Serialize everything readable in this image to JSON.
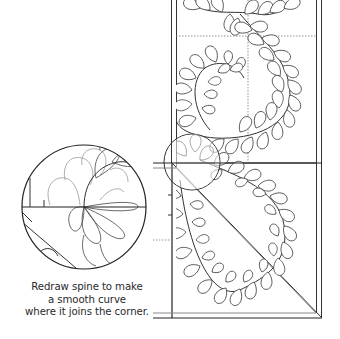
{
  "figure": {
    "type": "quilting-pattern-diagram",
    "caption": {
      "lines": [
        "Redraw spine to make",
        "a smooth curve",
        "where it joins the corner."
      ]
    },
    "colors": {
      "line": "#333333",
      "guide": "#888888",
      "background": "#ffffff",
      "text": "#2a2a2a"
    },
    "elements": {
      "border_frame": "double-line border strip with corner",
      "guides": "dotted registration lines",
      "magnifier": "circle detail showing spine junction at corner",
      "corner_diagonal": "45-degree miter line"
    }
  }
}
